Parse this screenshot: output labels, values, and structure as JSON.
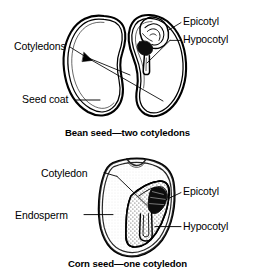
{
  "figure": {
    "background_color": "#ffffff",
    "ink_color": "#000000"
  },
  "diagrams": [
    {
      "id": "bean",
      "caption": "Bean seed—two cotyledons",
      "description": "Dicot bean seed split open showing two cotyledons, seed coat, epicotyl and hypocotyl",
      "labels": [
        {
          "id": "bean-cotyledons",
          "text": "Cotyledons",
          "side": "left"
        },
        {
          "id": "bean-seedcoat",
          "text": "Seed coat",
          "side": "left"
        },
        {
          "id": "bean-epicotyl",
          "text": "Epicotyl",
          "side": "right"
        },
        {
          "id": "bean-hypocotyl",
          "text": "Hypocotyl",
          "side": "right"
        }
      ]
    },
    {
      "id": "corn",
      "caption": "Corn seed—one cotyledon",
      "description": "Monocot corn kernel in section showing single cotyledon, endosperm, epicotyl and hypocotyl",
      "labels": [
        {
          "id": "corn-cotyledon",
          "text": "Cotyledon",
          "side": "left"
        },
        {
          "id": "corn-endosperm",
          "text": "Endosperm",
          "side": "left"
        },
        {
          "id": "corn-epicotyl",
          "text": "Epicotyl",
          "side": "right"
        },
        {
          "id": "corn-hypocotyl",
          "text": "Hypocotyl",
          "side": "right"
        }
      ]
    }
  ]
}
